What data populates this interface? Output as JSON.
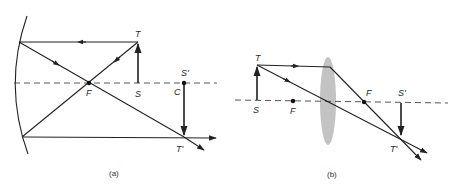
{
  "figure": {
    "panel_a": {
      "caption": "(a)",
      "description": "Concave mirror ray diagram",
      "labels": {
        "T": "T",
        "S": "S",
        "F": "F",
        "S_prime": "S'",
        "C": "C",
        "T_prime": "T'"
      }
    },
    "panel_b": {
      "caption": "(b)",
      "description": "Converging lens ray diagram",
      "labels": {
        "T": "T",
        "S": "S",
        "F_left": "F",
        "F_right": "F",
        "S_prime": "S'",
        "T_prime": "T'"
      }
    },
    "colors": {
      "line": "#222222",
      "lens": "#bdbdbd",
      "background": "#ffffff"
    }
  }
}
